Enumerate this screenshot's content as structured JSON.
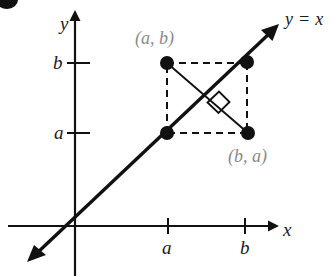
{
  "figure": {
    "type": "coordinate-plane-diagram",
    "background_color": "#ffffff",
    "ink_color": "#111111",
    "label_gray": "#8a8a8a"
  },
  "axes": {
    "x_axis_label": "x",
    "y_axis_label": "y",
    "origin": {
      "x": 75,
      "y": 226
    },
    "x_ticks": [
      {
        "label": "a",
        "x": 168
      },
      {
        "label": "b",
        "x": 245
      }
    ],
    "y_ticks": [
      {
        "label": "b",
        "y": 63
      },
      {
        "label": "a",
        "y": 133
      }
    ]
  },
  "line": {
    "equation_label": "y = x",
    "slope": 1,
    "intercept": 0,
    "arrow_both_ends": true
  },
  "points": [
    {
      "name": "point-a-b",
      "label": "(a, b)",
      "x": 167,
      "y": 63,
      "coord_x_tick": "a",
      "coord_y_tick": "b"
    },
    {
      "name": "point-b-b",
      "label": "",
      "x": 247,
      "y": 62,
      "coord_x_tick": "b",
      "coord_y_tick": "b"
    },
    {
      "name": "point-a-a",
      "label": "",
      "x": 167,
      "y": 133,
      "coord_x_tick": "a",
      "coord_y_tick": "a"
    },
    {
      "name": "point-b-a",
      "label": "(b, a)",
      "x": 248,
      "y": 133,
      "coord_x_tick": "b",
      "coord_y_tick": "a"
    }
  ],
  "annotations": {
    "right_angle_marker": true,
    "right_angle_note": "square marker where segment (a,b)-(b,a) crosses the line y = x",
    "dashed_square_note": "dashed square connecting the four lattice points"
  },
  "labels": {
    "y_axis": "y",
    "x_axis": "x",
    "y_tick_b": "b",
    "y_tick_a": "a",
    "x_tick_a": "a",
    "x_tick_b": "b",
    "line_equation": "y = x",
    "point_ab": "(a, b)",
    "point_ba": "(b, a)"
  }
}
